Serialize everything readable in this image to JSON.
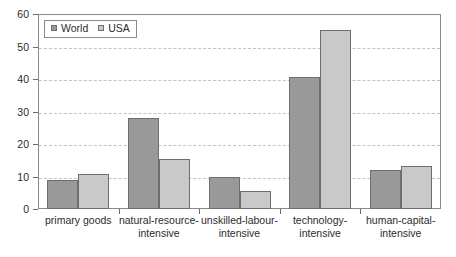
{
  "chart_data": {
    "type": "bar",
    "title": "",
    "subtitle": "",
    "xlabel": "",
    "ylabel": "",
    "ylim": [
      0,
      60
    ],
    "ytick_values": [
      0,
      10,
      20,
      30,
      40,
      50,
      60
    ],
    "ytick_labels": [
      "0",
      "10",
      "20",
      "30",
      "40",
      "50",
      "60"
    ],
    "grid": true,
    "grid_axis": "y",
    "legend_position": "top-left",
    "categories": [
      "primary goods",
      "natural-resource-\nintensive",
      "unskilled-labour-\nintensive",
      "technology-\nintensive",
      "human-capital-\nintensive"
    ],
    "series": [
      {
        "name": "World",
        "color": "#999999",
        "values": [
          9.0,
          28.0,
          10.0,
          40.5,
          12.0
        ]
      },
      {
        "name": "USA",
        "color": "#c9c9c9",
        "values": [
          10.7,
          15.5,
          5.5,
          55.0,
          13.3
        ]
      }
    ],
    "annotations": []
  },
  "legend": {
    "entries": [
      {
        "label": "World",
        "swatch_icon": "square-swatch-icon"
      },
      {
        "label": "USA",
        "swatch_icon": "square-swatch-icon"
      }
    ]
  },
  "style": {
    "plot_border_color": "#8a8a8a",
    "gridline_color": "#b9c4d6",
    "axis_tick_color": "#6b6b6b",
    "bar_outline_color": "#6e6e6e",
    "text_color": "#2b2b2b",
    "background": "#ffffff"
  }
}
